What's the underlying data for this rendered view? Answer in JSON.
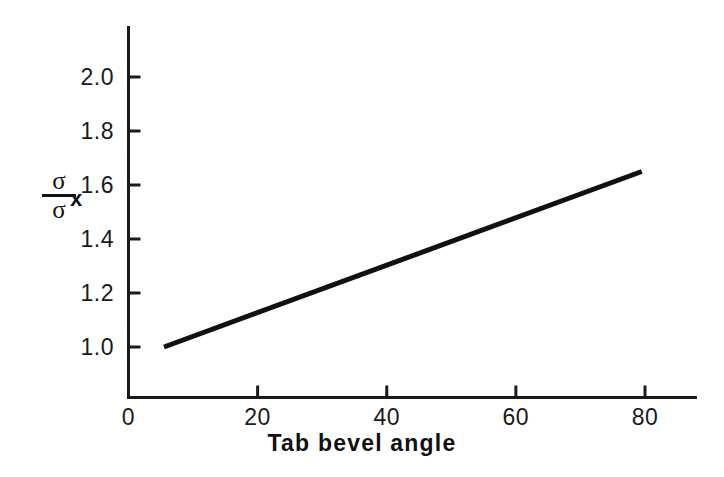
{
  "chart_data": {
    "type": "line",
    "title": "",
    "subtitle": "",
    "xlabel": "Tab bevel angle",
    "ylabel_numerator": "σ",
    "ylabel_numerator_subscript": "x",
    "ylabel_denominator": "σ",
    "ylabel_text": "σx / σ",
    "xlim": [
      0,
      88
    ],
    "ylim": [
      0.9,
      2.12
    ],
    "xticks": [
      0,
      20,
      40,
      60,
      80
    ],
    "xtick_labels": [
      "0",
      "20",
      "40",
      "60",
      "80"
    ],
    "yticks": [
      1.0,
      1.2,
      1.4,
      1.6,
      1.8,
      2.0
    ],
    "ytick_labels": [
      "1.0",
      "1.2",
      "1.4",
      "1.6",
      "1.8",
      "2.0"
    ],
    "grid": false,
    "legend": false,
    "legend_position": "none",
    "line_color": "#111111",
    "line_width_px": 5,
    "series": [
      {
        "name": "sigma_x/sigma_bar",
        "x": [
          5.5,
          79.5
        ],
        "y": [
          1.0,
          1.65
        ]
      }
    ],
    "annotations": []
  },
  "axes": {
    "axis_color": "#1a1a1a",
    "axis_line_width_px": 3,
    "tick_length_px": 12,
    "spines": [
      "left",
      "bottom"
    ]
  },
  "figure": {
    "background": "#ffffff",
    "width_px": 724,
    "height_px": 477
  }
}
